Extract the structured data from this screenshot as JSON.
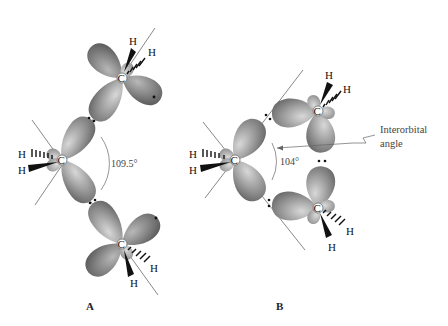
{
  "figure": {
    "panels": [
      {
        "id": "A",
        "label": "A",
        "angle_label": "109.5°",
        "atoms": {
          "carbon_top": "C",
          "carbon_middle": "C",
          "carbon_bottom": "C",
          "h_top_1": "H",
          "h_top_2": "H",
          "h_mid_1": "H",
          "h_mid_2": "H",
          "h_bottom_1": "H",
          "h_bottom_2": "H"
        }
      },
      {
        "id": "B",
        "label": "B",
        "angle_label": "104°",
        "callout": {
          "line1": "Interorbital",
          "line2": "angle"
        },
        "atoms": {
          "carbon_left": "C",
          "carbon_upper": "C",
          "carbon_lower": "C",
          "h_left_1": "H",
          "h_left_2": "H",
          "h_upper_1": "H",
          "h_upper_2": "H",
          "h_lower_1": "H",
          "h_lower_2": "H"
        }
      }
    ],
    "colors": {
      "lobe_light": "#c9c9c9",
      "lobe_mid": "#9a9a9a",
      "lobe_dark": "#6e6e6e",
      "line": "#555555",
      "background": "#ffffff"
    }
  }
}
